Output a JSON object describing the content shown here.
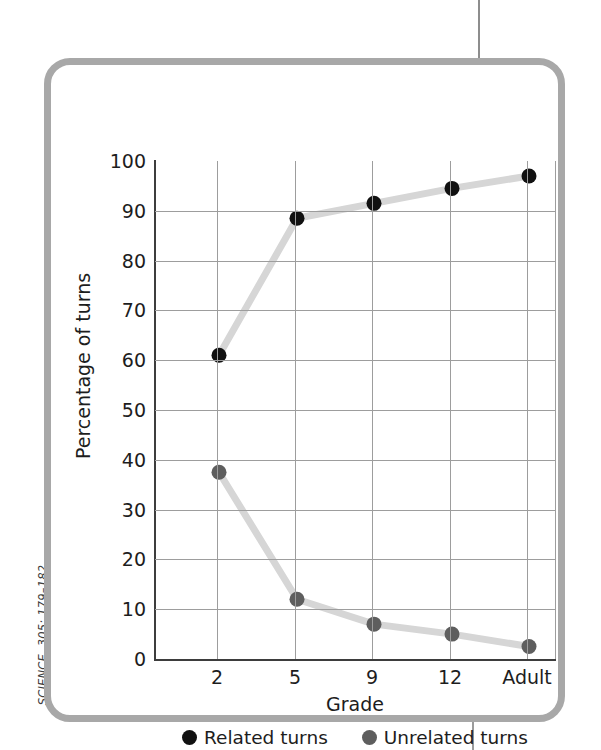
{
  "figure": {
    "source_caption": "SCIENCE, 305: 179–182"
  },
  "chart_data": {
    "type": "line",
    "title": "",
    "xlabel": "Grade",
    "ylabel": "Percentage of turns",
    "categories": [
      "2",
      "5",
      "9",
      "12",
      "Adult"
    ],
    "ylim": [
      0,
      100
    ],
    "yticks": [
      "0",
      "10",
      "20",
      "30",
      "40",
      "50",
      "60",
      "70",
      "80",
      "90",
      "100"
    ],
    "ytick_values": [
      0,
      10,
      20,
      30,
      40,
      50,
      60,
      70,
      80,
      90,
      100
    ],
    "grid": true,
    "legend_position": "bottom-center",
    "series": [
      {
        "name": "Related turns",
        "marker_color": "#111111",
        "line_color": "#d6d6d6",
        "values": [
          61,
          88.5,
          91.5,
          94.5,
          97
        ]
      },
      {
        "name": "Unrelated turns",
        "marker_color": "#5e5e5e",
        "line_color": "#d6d6d6",
        "values": [
          37.5,
          12,
          7,
          5,
          2.5
        ]
      }
    ]
  },
  "colors": {
    "frame": "#a8a8a8",
    "grid": "#9d9d9d",
    "axis": "#3d3d3d",
    "related_marker": "#111111",
    "unrelated_marker": "#5e5e5e",
    "connector_line": "#d6d6d6"
  }
}
